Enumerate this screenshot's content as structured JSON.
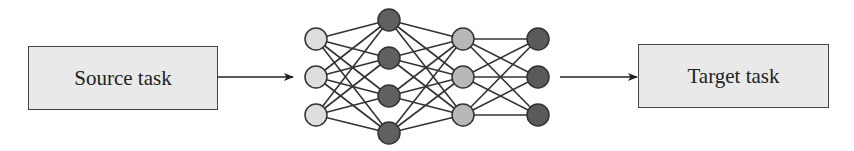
{
  "diagram": {
    "source": {
      "label": "Source task"
    },
    "target": {
      "label": "Target task"
    },
    "network": {
      "layers": [
        {
          "x": 316,
          "ys": [
            39,
            77,
            115
          ],
          "fill": "#dedede"
        },
        {
          "x": 389,
          "ys": [
            20,
            58,
            96,
            133
          ],
          "fill": "#606060"
        },
        {
          "x": 463,
          "ys": [
            39,
            77,
            115
          ],
          "fill": "#b8b8b8"
        },
        {
          "x": 538,
          "ys": [
            39,
            77,
            115
          ],
          "fill": "#5a5a5a"
        }
      ],
      "node_radius": 11,
      "edge_color": "#333333",
      "node_stroke": "#333333"
    },
    "arrows": [
      {
        "from": [
          218,
          77
        ],
        "to": [
          293,
          77
        ]
      },
      {
        "from": [
          560,
          77
        ],
        "to": [
          637,
          77
        ]
      }
    ]
  }
}
